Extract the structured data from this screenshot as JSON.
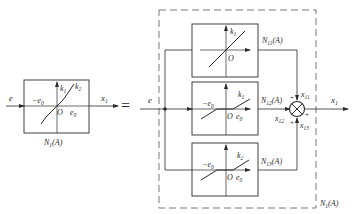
{
  "diagram": {
    "type": "block-diagram",
    "colors": {
      "stroke": "#2a2a2a",
      "dashed": "#555555",
      "background": "#ffffff"
    },
    "left_block": {
      "input": "e",
      "output": "x1",
      "output_sub": "1",
      "label": "N1(A)",
      "curve_labels": {
        "k1": "k",
        "k1_sub": "1",
        "k2": "k",
        "k2_sub": "2"
      },
      "axis_labels": {
        "neg_e0": "−e",
        "neg_e0_sub": "0",
        "origin": "O",
        "e0": "e",
        "e0_sub": "0"
      }
    },
    "equals": "=",
    "decomposition": {
      "input": "e",
      "output": "x",
      "output_sub": "1",
      "outer_label": "N",
      "outer_label_sub": "1",
      "outer_label_arg": "(A)",
      "blocks": [
        {
          "id": "N11",
          "label": "N",
          "label_sub": "11",
          "label_arg": "(A)",
          "slope": "k",
          "slope_sub": "1",
          "origin": "O",
          "type": "linear"
        },
        {
          "id": "N12",
          "label": "N",
          "label_sub": "12",
          "label_arg": "(A)",
          "slope": "k",
          "slope_sub": "1",
          "origin": "O",
          "neg_e0": "−e",
          "e0": "e",
          "e0_sub": "0",
          "type": "dead-zone"
        },
        {
          "id": "N13",
          "label": "N",
          "label_sub": "13",
          "label_arg": "(A)",
          "slope": "k",
          "slope_sub": "2",
          "origin": "O",
          "neg_e0": "−e",
          "e0": "e",
          "e0_sub": "0",
          "type": "dead-zone"
        }
      ],
      "summer": {
        "inputs": [
          {
            "name": "x",
            "sub": "11",
            "sign": "+"
          },
          {
            "name": "x",
            "sub": "12",
            "sign": "+"
          },
          {
            "name": "x",
            "sub": "13",
            "sign": "+"
          }
        ],
        "output_sign": "+"
      }
    }
  }
}
